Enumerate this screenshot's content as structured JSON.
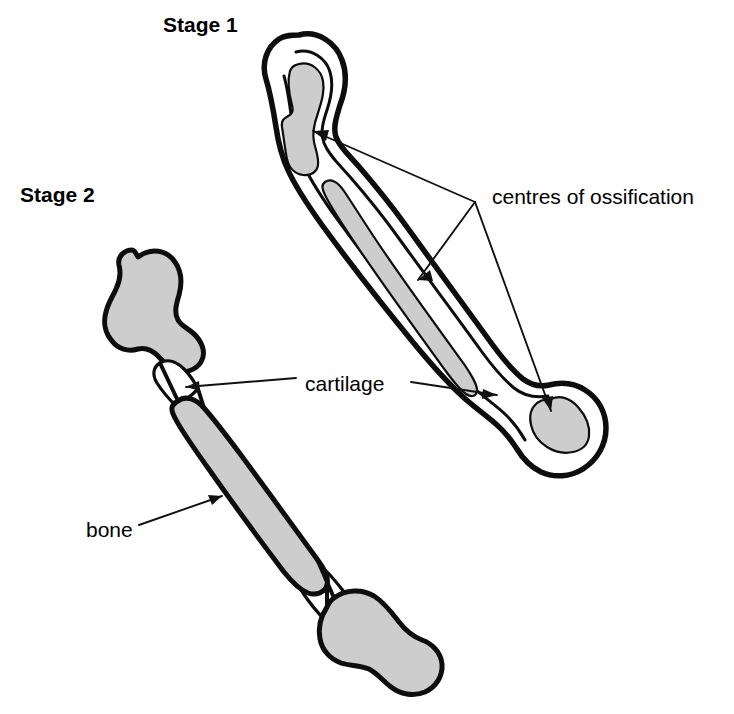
{
  "figure": {
    "title_present": false,
    "background_color": "#ffffff",
    "line_color": "#0d0d0d",
    "fill_gray": "#cdcdcd",
    "fill_white": "#ffffff"
  },
  "stages": [
    {
      "id": "stage-1",
      "label": "Stage 1",
      "label_x": 163,
      "label_y": 26,
      "description_regions": [
        "proximal centre of ossification",
        "diaphyseal centre of ossification",
        "distal centre of ossification",
        "cartilage"
      ]
    },
    {
      "id": "stage-2",
      "label": "Stage 2",
      "label_x": 20,
      "label_y": 196,
      "description_regions": [
        "proximal bone epiphysis",
        "bone shaft",
        "distal bone epiphysis",
        "cartilage growth plates"
      ]
    }
  ],
  "annotations": [
    {
      "id": "centres-of-ossification",
      "text": "centres of ossification",
      "text_x": 492,
      "text_y": 198,
      "anchor": "start",
      "leader_converge": {
        "x": 475,
        "y": 202
      },
      "targets": [
        {
          "name": "proximal-centre",
          "x": 313,
          "y": 131
        },
        {
          "name": "diaphyseal-centre",
          "x": 418,
          "y": 280
        },
        {
          "name": "distal-centre",
          "x": 551,
          "y": 411
        }
      ]
    },
    {
      "id": "cartilage",
      "text": "cartilage",
      "text_x": 305,
      "text_y": 385,
      "anchor": "start",
      "targets": [
        {
          "name": "stage2-proximal-growth-plate",
          "x": 186,
          "y": 387
        },
        {
          "name": "stage1-shaft-cartilage",
          "x": 497,
          "y": 395
        }
      ]
    },
    {
      "id": "bone",
      "text": "bone",
      "text_x": 86,
      "text_y": 531,
      "anchor": "start",
      "targets": [
        {
          "name": "stage2-bone-shaft",
          "x": 222,
          "y": 496
        }
      ]
    }
  ]
}
